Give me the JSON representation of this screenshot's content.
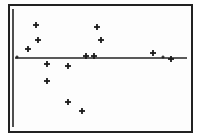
{
  "chart_data": {
    "type": "scatter",
    "title": "",
    "xlabel": "",
    "ylabel": "",
    "grid": false,
    "legend": null,
    "marker": "plus",
    "axis_color": "#222222",
    "marker_color": "#1a1a1a",
    "frame": {
      "x": 9,
      "y": 5,
      "width": 183,
      "height": 127
    },
    "y_axis": {
      "x": 13,
      "y1": 9,
      "y2": 127
    },
    "x_axis": {
      "y": 58,
      "x1": 15,
      "x2": 187
    },
    "points": [
      {
        "x": 17,
        "y": 57,
        "size": "small"
      },
      {
        "x": 28,
        "y": 49,
        "size": "normal"
      },
      {
        "x": 36,
        "y": 25,
        "size": "normal"
      },
      {
        "x": 38,
        "y": 40,
        "size": "normal"
      },
      {
        "x": 47,
        "y": 64,
        "size": "normal"
      },
      {
        "x": 47,
        "y": 81,
        "size": "normal"
      },
      {
        "x": 68,
        "y": 66,
        "size": "normal"
      },
      {
        "x": 68,
        "y": 102,
        "size": "normal"
      },
      {
        "x": 82,
        "y": 111,
        "size": "normal"
      },
      {
        "x": 86,
        "y": 56,
        "size": "normal"
      },
      {
        "x": 94,
        "y": 56,
        "size": "normal"
      },
      {
        "x": 97,
        "y": 27,
        "size": "normal"
      },
      {
        "x": 101,
        "y": 40,
        "size": "normal"
      },
      {
        "x": 153,
        "y": 53,
        "size": "normal"
      },
      {
        "x": 163,
        "y": 57,
        "size": "small"
      },
      {
        "x": 171,
        "y": 59,
        "size": "normal"
      }
    ],
    "note": "Calculator-style residual plot; points given in screen pixel coordinates; no axis tick labels visible"
  }
}
